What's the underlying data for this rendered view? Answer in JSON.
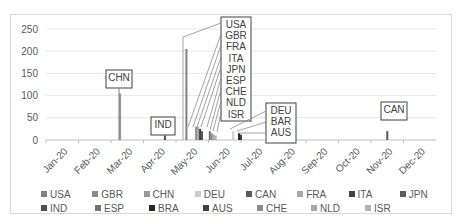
{
  "chart_data": {
    "type": "bar",
    "title": "",
    "xlabel": "",
    "ylabel": "",
    "ylim": [
      0,
      250
    ],
    "yticks": [
      0,
      50,
      100,
      150,
      200,
      250
    ],
    "grid": true,
    "legend_position": "bottom",
    "categories": [
      "Jan-20",
      "Feb-20",
      "Mar-20",
      "Apr-20",
      "May-20",
      "Jun-20",
      "Jul-20",
      "Aug-20",
      "Sep-20",
      "Oct-20",
      "Nov-20",
      "Dec-20"
    ],
    "series": [
      {
        "name": "USA",
        "date": "May-20",
        "x_frac": 0.36,
        "value": 205,
        "color": "#7f7f7f"
      },
      {
        "name": "GBR",
        "date": "May-20",
        "x_frac": 0.385,
        "value": 30,
        "color": "#8c8c8c"
      },
      {
        "name": "CHN",
        "date": "Mar-20",
        "x_frac": 0.19,
        "value": 105,
        "color": "#999999"
      },
      {
        "name": "DEU",
        "date": "Jun-20",
        "x_frac": 0.48,
        "value": 20,
        "color": "#cccccc"
      },
      {
        "name": "CAN",
        "date": "Nov-20",
        "x_frac": 0.875,
        "value": 20,
        "color": "#595959"
      },
      {
        "name": "FRA",
        "date": "May-20",
        "x_frac": 0.39,
        "value": 30,
        "color": "#a6a6a6"
      },
      {
        "name": "ITA",
        "date": "May-20",
        "x_frac": 0.395,
        "value": 25,
        "color": "#404040"
      },
      {
        "name": "JPN",
        "date": "May-20",
        "x_frac": 0.4,
        "value": 20,
        "color": "#595959"
      },
      {
        "name": "IND",
        "date": "Apr-20",
        "x_frac": 0.305,
        "value": 10,
        "color": "#4d4d4d"
      },
      {
        "name": "ESP",
        "date": "May-20",
        "x_frac": 0.42,
        "value": 20,
        "color": "#737373"
      },
      {
        "name": "BRA",
        "date": "Jun-20",
        "x_frac": 0.495,
        "value": 15,
        "color": "#262626"
      },
      {
        "name": "AUS",
        "date": "Jun-20",
        "x_frac": 0.5,
        "value": 12,
        "color": "#404040"
      },
      {
        "name": "CHE",
        "date": "May-20",
        "x_frac": 0.425,
        "value": 15,
        "color": "#8c8c8c"
      },
      {
        "name": "NLD",
        "date": "May-20",
        "x_frac": 0.43,
        "value": 12,
        "color": "#a6a6a6"
      },
      {
        "name": "ISR",
        "date": "May-20",
        "x_frac": 0.435,
        "value": 10,
        "color": "#b3b3b3"
      }
    ],
    "annotations": [
      {
        "text": "CHN"
      },
      {
        "text": "IND"
      },
      {
        "text": "USA"
      },
      {
        "text": "GBR"
      },
      {
        "text": "FRA"
      },
      {
        "text": "ITA"
      },
      {
        "text": "JPN"
      },
      {
        "text": "ESP"
      },
      {
        "text": "CHE"
      },
      {
        "text": "NLD"
      },
      {
        "text": "ISR"
      },
      {
        "text": "DEU"
      },
      {
        "text": "BAR"
      },
      {
        "text": "AUS"
      },
      {
        "text": "CAN"
      }
    ]
  },
  "legend": {
    "row1": [
      "USA",
      "GBR",
      "CHN",
      "DEU",
      "CAN",
      "FRA",
      "ITA",
      "JPN"
    ],
    "row2": [
      "IND",
      "ESP",
      "BRA",
      "AUS",
      "CHE",
      "NLD",
      "ISR"
    ],
    "colors1": [
      "#7f7f7f",
      "#8c8c8c",
      "#999999",
      "#cccccc",
      "#595959",
      "#a6a6a6",
      "#404040",
      "#595959"
    ],
    "colors2": [
      "#4d4d4d",
      "#737373",
      "#262626",
      "#404040",
      "#8c8c8c",
      "#a6a6a6",
      "#b3b3b3"
    ]
  }
}
